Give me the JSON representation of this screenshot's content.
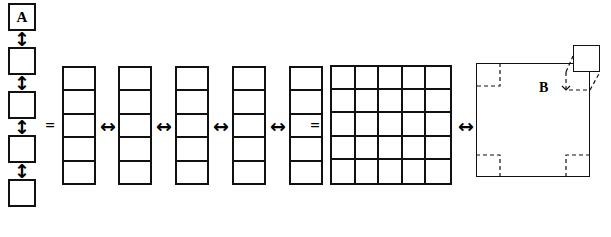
{
  "figure": {
    "title": "",
    "background_color": "#ffffff",
    "line_color": "#111111",
    "width": 611,
    "height": 237
  },
  "labels": {
    "unit_square": "A",
    "big_square": "B",
    "equals_1": "=",
    "equals_2": "=",
    "arrow_vertical": "↕",
    "arrow_horizontal": "↔"
  },
  "left_stack": {
    "name": "vertical-unit-square-stack",
    "count": 5,
    "labeled_index": 0,
    "squares": [
      {
        "label": "A"
      },
      {
        "label": ""
      },
      {
        "label": ""
      },
      {
        "label": ""
      },
      {
        "label": ""
      }
    ],
    "separators": 4
  },
  "middle_columns": {
    "name": "five-columns-of-five",
    "column_count": 5,
    "cells_per_column": 5,
    "separator_arrows": 4
  },
  "grid": {
    "name": "five-by-five-grid",
    "rows": 5,
    "cols": 5,
    "total_cells": 25
  },
  "big_square": {
    "name": "area-square-B",
    "label": "B",
    "dashed_corner_count": 3,
    "inset_small_square_label": ""
  },
  "relations": {
    "equals_between_stack_and_columns": "=",
    "equals_between_columns_and_grid": "=",
    "arrow_between_grid_and_b": "↔"
  }
}
